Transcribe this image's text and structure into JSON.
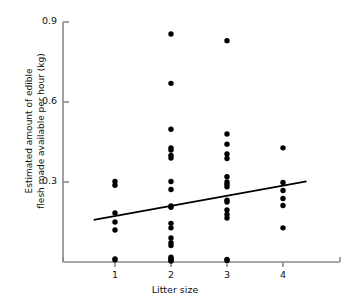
{
  "chart_data": {
    "type": "scatter",
    "title": "",
    "xlabel": "Litter size",
    "ylabel": "Estimated amount of edible flesh made available per hour (kg)",
    "ylabel_line1": "Estimated amount of edible",
    "ylabel_line2": "flesh made available per hour (kg)",
    "xlim": [
      0.5,
      4.6
    ],
    "ylim": [
      0.0,
      0.9
    ],
    "xticks": [
      1,
      2,
      3,
      4
    ],
    "xtick_labels": [
      "1",
      "2",
      "3",
      "4"
    ],
    "yticks": [
      0.3,
      0.6,
      0.9
    ],
    "ytick_labels": [
      "0.3",
      "0.6",
      "0.9"
    ],
    "grid": false,
    "legend": null,
    "marker": "filled-circle",
    "marker_color": "#000000",
    "axis_color": "#8a8a8a",
    "points": [
      {
        "x": 1,
        "y": 0.302
      },
      {
        "x": 1,
        "y": 0.288
      },
      {
        "x": 1,
        "y": 0.184
      },
      {
        "x": 1,
        "y": 0.15
      },
      {
        "x": 1,
        "y": 0.12
      },
      {
        "x": 1,
        "y": 0.011
      },
      {
        "x": 1,
        "y": 0.008
      },
      {
        "x": 2,
        "y": 0.855
      },
      {
        "x": 2,
        "y": 0.67
      },
      {
        "x": 2,
        "y": 0.498
      },
      {
        "x": 2,
        "y": 0.428
      },
      {
        "x": 2,
        "y": 0.42
      },
      {
        "x": 2,
        "y": 0.4
      },
      {
        "x": 2,
        "y": 0.39
      },
      {
        "x": 2,
        "y": 0.302
      },
      {
        "x": 2,
        "y": 0.272
      },
      {
        "x": 2,
        "y": 0.21
      },
      {
        "x": 2,
        "y": 0.205
      },
      {
        "x": 2,
        "y": 0.145
      },
      {
        "x": 2,
        "y": 0.128
      },
      {
        "x": 2,
        "y": 0.09
      },
      {
        "x": 2,
        "y": 0.072
      },
      {
        "x": 2,
        "y": 0.062
      },
      {
        "x": 2,
        "y": 0.018
      },
      {
        "x": 2,
        "y": 0.012
      },
      {
        "x": 2,
        "y": 0.008
      },
      {
        "x": 2,
        "y": 0.004
      },
      {
        "x": 3,
        "y": 0.83
      },
      {
        "x": 3,
        "y": 0.48
      },
      {
        "x": 3,
        "y": 0.442
      },
      {
        "x": 3,
        "y": 0.405
      },
      {
        "x": 3,
        "y": 0.388
      },
      {
        "x": 3,
        "y": 0.32
      },
      {
        "x": 3,
        "y": 0.3
      },
      {
        "x": 3,
        "y": 0.292
      },
      {
        "x": 3,
        "y": 0.282
      },
      {
        "x": 3,
        "y": 0.232
      },
      {
        "x": 3,
        "y": 0.225
      },
      {
        "x": 3,
        "y": 0.195
      },
      {
        "x": 3,
        "y": 0.178
      },
      {
        "x": 3,
        "y": 0.165
      },
      {
        "x": 3,
        "y": 0.01
      },
      {
        "x": 3,
        "y": 0.006
      },
      {
        "x": 4,
        "y": 0.428
      },
      {
        "x": 4,
        "y": 0.298
      },
      {
        "x": 4,
        "y": 0.268
      },
      {
        "x": 4,
        "y": 0.238
      },
      {
        "x": 4,
        "y": 0.212
      },
      {
        "x": 4,
        "y": 0.128
      }
    ],
    "trendline": {
      "type": "linear",
      "x_start": 0.62,
      "y_start": 0.158,
      "x_end": 4.42,
      "y_end": 0.302,
      "color": "#000000"
    }
  }
}
